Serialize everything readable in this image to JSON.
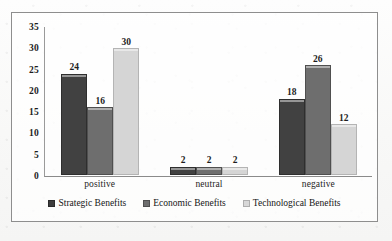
{
  "chart_data": {
    "type": "bar",
    "title": "",
    "xlabel": "",
    "ylabel": "",
    "categories": [
      "positive",
      "neutral",
      "negative"
    ],
    "series": [
      {
        "name": "Strategic Benefits",
        "color": "#414141",
        "values": [
          24,
          2,
          18
        ]
      },
      {
        "name": "Economic Benefits",
        "color": "#6e6e6e",
        "values": [
          16,
          2,
          26
        ]
      },
      {
        "name": "Technological Benefits",
        "color": "#d5d5d5",
        "values": [
          30,
          2,
          12
        ]
      }
    ],
    "ylim": [
      0,
      35
    ],
    "yticks": [
      0,
      5,
      10,
      15,
      20,
      25,
      30,
      35
    ],
    "ytick_labels": [
      "0",
      "5",
      "10",
      "15",
      "20",
      "25",
      "30",
      "35"
    ],
    "grid": false,
    "legend_position": "bottom",
    "data_labels": true
  },
  "legend": {
    "items": [
      {
        "label": "Strategic Benefits"
      },
      {
        "label": "Economic Benefits"
      },
      {
        "label": "Technological Benefits"
      }
    ]
  }
}
